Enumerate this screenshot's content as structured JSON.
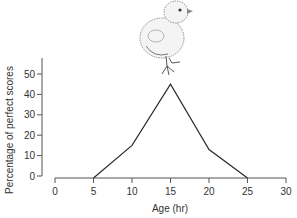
{
  "chart_data": {
    "type": "line",
    "title": "",
    "xlabel": "Age (hr)",
    "ylabel": "Percentage of perfect scores",
    "x": [
      5,
      10,
      15,
      20,
      25
    ],
    "series": [
      {
        "name": "Percentage of perfect scores",
        "values": [
          0,
          15,
          45,
          13,
          0
        ]
      }
    ],
    "xlim": [
      0,
      30
    ],
    "ylim": [
      0,
      50
    ],
    "xticks": [
      0,
      5,
      10,
      15,
      20,
      25,
      30
    ],
    "yticks": [
      0,
      10,
      20,
      30,
      40,
      50
    ],
    "grid": false,
    "legend": "none",
    "annotations": [
      "chick illustration above peak"
    ]
  },
  "colors": {
    "line": "#2a2a2a",
    "axis": "#555555"
  }
}
